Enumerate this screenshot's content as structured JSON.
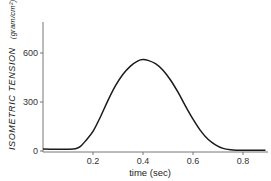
{
  "chart_data": {
    "type": "line",
    "title": "",
    "xlabel": "time (sec)",
    "ylabel": "ISOMETRIC TENSION",
    "ylabel_unit": "(gram/cm²)",
    "xlim": [
      0,
      0.9
    ],
    "ylim": [
      0,
      790
    ],
    "grid": false,
    "xticks": [
      0.2,
      0.4,
      0.6,
      0.8
    ],
    "xtick_labels": [
      "0.2",
      "0.4",
      "0.6",
      "0.8"
    ],
    "yticks": [
      0,
      300,
      600
    ],
    "ytick_labels": [
      "0",
      "300",
      "600"
    ],
    "series": [
      {
        "name": "isometric tension",
        "color": "#1a1a1a",
        "x": [
          0.0,
          0.05,
          0.1,
          0.13,
          0.15,
          0.17,
          0.2,
          0.23,
          0.26,
          0.29,
          0.32,
          0.35,
          0.38,
          0.4,
          0.42,
          0.45,
          0.48,
          0.51,
          0.54,
          0.57,
          0.6,
          0.63,
          0.66,
          0.69,
          0.72,
          0.75,
          0.78,
          0.8,
          0.85,
          0.89
        ],
        "y": [
          12,
          11,
          11,
          14,
          28,
          62,
          120,
          210,
          310,
          400,
          470,
          520,
          552,
          560,
          555,
          535,
          495,
          435,
          360,
          275,
          195,
          125,
          72,
          38,
          16,
          7,
          5,
          5,
          5,
          5
        ]
      }
    ]
  }
}
